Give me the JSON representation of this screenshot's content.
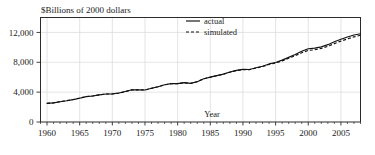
{
  "chart_data": {
    "type": "line",
    "title": "$Billions of 2000 dollars",
    "xlabel": "Year",
    "ylabel": "",
    "xlim": [
      1959,
      2008
    ],
    "ylim": [
      0,
      14000
    ],
    "grid": true,
    "legend_position": "top-center",
    "y_ticks": [
      0,
      4000,
      8000,
      12000
    ],
    "y_tick_labels": [
      "0",
      "4,000",
      "8,000",
      "12,000"
    ],
    "x_ticks": [
      1960,
      1965,
      1970,
      1975,
      1980,
      1985,
      1990,
      1995,
      2000,
      2005
    ],
    "x_tick_labels": [
      "1960",
      "1965",
      "1970",
      "1975",
      "1980",
      "1985",
      "1990",
      "1995",
      "2000",
      "2005"
    ],
    "x_minor_tick_interval": 1,
    "x": [
      1960,
      1961,
      1962,
      1963,
      1964,
      1965,
      1966,
      1967,
      1968,
      1969,
      1970,
      1971,
      1972,
      1973,
      1974,
      1975,
      1976,
      1977,
      1978,
      1979,
      1980,
      1981,
      1982,
      1983,
      1984,
      1985,
      1986,
      1987,
      1988,
      1989,
      1990,
      1991,
      1992,
      1993,
      1994,
      1995,
      1996,
      1997,
      1998,
      1999,
      2000,
      2001,
      2002,
      2003,
      2004,
      2005,
      2006,
      2007,
      2008
    ],
    "series": [
      {
        "name": "actual",
        "style": "solid",
        "values": [
          2500,
          2560,
          2720,
          2840,
          3000,
          3190,
          3400,
          3480,
          3640,
          3750,
          3760,
          3880,
          4090,
          4320,
          4300,
          4290,
          4520,
          4730,
          4990,
          5150,
          5140,
          5270,
          5170,
          5400,
          5790,
          6010,
          6220,
          6420,
          6690,
          6920,
          7050,
          7040,
          7270,
          7470,
          7780,
          7980,
          8290,
          8660,
          9050,
          9470,
          9820,
          9890,
          10070,
          10360,
          10740,
          11080,
          11390,
          11650,
          11830
        ]
      },
      {
        "name": "simulated",
        "style": "dashed",
        "values": [
          2500,
          2570,
          2730,
          2850,
          3010,
          3200,
          3410,
          3490,
          3630,
          3740,
          3750,
          3870,
          4080,
          4310,
          4310,
          4300,
          4510,
          4720,
          4970,
          5130,
          5130,
          5260,
          5180,
          5410,
          5790,
          6000,
          6200,
          6400,
          6660,
          6890,
          7020,
          7010,
          7230,
          7420,
          7710,
          7900,
          8190,
          8530,
          8890,
          9270,
          9590,
          9680,
          9870,
          10140,
          10500,
          10830,
          11130,
          11400,
          11620
        ]
      }
    ],
    "legend": [
      {
        "label": "actual",
        "style": "solid"
      },
      {
        "label": "simulated",
        "style": "dashed"
      }
    ]
  }
}
